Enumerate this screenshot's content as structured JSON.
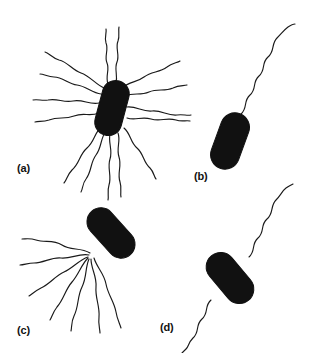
{
  "figure": {
    "background_color": "#ffffff",
    "ink_color": "#111111",
    "cell_fill_color": "#111111",
    "flagellum_stroke_color": "#1a1a1a",
    "width": 311,
    "height": 353
  },
  "panels": [
    {
      "id": "a",
      "label": "(a)",
      "arrangement": "peritrichous",
      "flagella_count": 14,
      "cell": {
        "shape": "rod-capsule",
        "center_x": 112,
        "center_y": 108,
        "length": 56,
        "width": 27,
        "rotation_deg": 15
      }
    },
    {
      "id": "b",
      "label": "(b)",
      "arrangement": "monotrichous",
      "flagella_count": 1,
      "cell": {
        "shape": "rod-capsule",
        "center_x": 230,
        "center_y": 141,
        "length": 58,
        "width": 29,
        "rotation_deg": 20
      }
    },
    {
      "id": "c",
      "label": "(c)",
      "arrangement": "lophotrichous",
      "flagella_count": 7,
      "cell": {
        "shape": "rod-capsule",
        "center_x": 111,
        "center_y": 233,
        "length": 58,
        "width": 28,
        "rotation_deg": -42
      }
    },
    {
      "id": "d",
      "label": "(d)",
      "arrangement": "amphitrichous",
      "flagella_count": 2,
      "cell": {
        "shape": "rod-capsule",
        "center_x": 230,
        "center_y": 278,
        "length": 58,
        "width": 29,
        "rotation_deg": -40
      }
    }
  ]
}
